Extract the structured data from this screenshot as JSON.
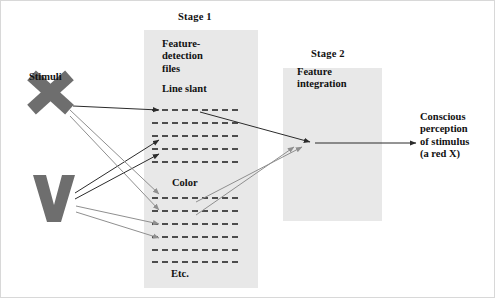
{
  "figure": {
    "background": "#ffffff"
  },
  "colors": {
    "panel_fill": "#e8e8e8",
    "stimulus_gray": "#6e6e6e",
    "dark_arrow": "#2b2b2b",
    "gray_arrow": "#8f8f8f",
    "dash_color": "#1a1a1a",
    "text": "#111111"
  },
  "stage1": {
    "title": "Stage 1",
    "heading": "Feature-\ndetection\nfiles",
    "file_line_slant": "Line slant",
    "file_color": "Color",
    "file_etc": "Etc.",
    "line_slant_rows": 5,
    "color_rows": 6
  },
  "stage2": {
    "title": "Stage 2",
    "heading": "Feature\nintegration"
  },
  "stimuli": {
    "label": "Stimuli",
    "items": [
      {
        "name": "stimulus-x",
        "glyph": "X"
      },
      {
        "name": "stimulus-v",
        "glyph": "V"
      }
    ]
  },
  "output": {
    "label": "Conscious\nperception\nof stimulus\n(a red X)"
  },
  "arrows": {
    "x_to_line_slant": "dark",
    "v_to_line_slant": "dark",
    "x_to_color": "gray",
    "v_to_color": "gray",
    "stage1_to_stage2_dark": "dark",
    "stage1_to_stage2_gray": "gray",
    "stage2_to_output": "dark"
  }
}
